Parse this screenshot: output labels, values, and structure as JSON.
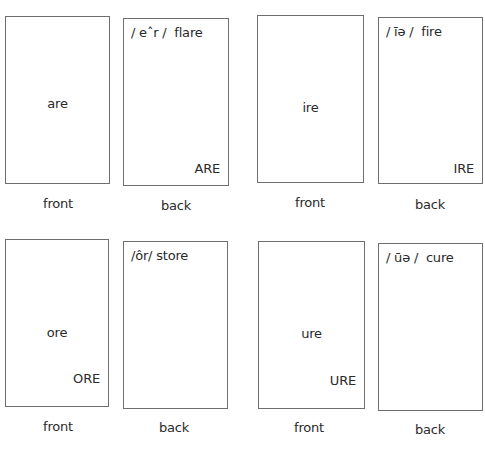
{
  "cards": [
    {
      "front": {
        "center": "are",
        "corner": "",
        "label": "front"
      },
      "back": {
        "phonetic": "/ eˆr /  flare",
        "corner": "ARE",
        "label": "back"
      }
    },
    {
      "front": {
        "center": "ire",
        "corner": "",
        "label": "front"
      },
      "back": {
        "phonetic": "/ īə /  fire",
        "corner": "IRE",
        "label": "back"
      }
    },
    {
      "front": {
        "center": "ore",
        "corner": "ORE",
        "label": "front"
      },
      "back": {
        "phonetic": "/ôr/ store",
        "corner": "",
        "label": "back"
      }
    },
    {
      "front": {
        "center": "ure",
        "corner": "URE",
        "label": "front"
      },
      "back": {
        "phonetic": "/ ūə /  cure",
        "corner": "",
        "label": "back"
      }
    }
  ]
}
